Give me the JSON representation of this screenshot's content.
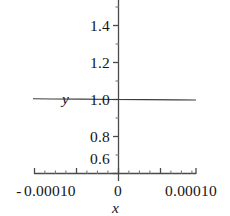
{
  "figure": {
    "background_color": "#ffffff",
    "ink_color": "#161616",
    "axis_color": "#4a4a4a",
    "curve_color": "#3d3d3d"
  },
  "axis_titles": {
    "x": "x",
    "y": "y"
  },
  "chart_data": {
    "type": "line",
    "title": "",
    "subtitle": "",
    "xlabel": "x",
    "ylabel": "y",
    "grid": false,
    "legend": null,
    "xlim": [
      -0.00013,
      0.00013
    ],
    "ylim": [
      0.5,
      1.5
    ],
    "x_ticks": [
      -0.0001,
      0,
      0.0001
    ],
    "x_tick_labels": [
      "-0.00010",
      "0",
      "0.00010"
    ],
    "y_ticks": [
      0.6,
      0.8,
      1.0,
      1.2,
      1.4
    ],
    "y_tick_labels": [
      "0.6",
      "0.8",
      "1.0",
      "1.2",
      "1.4"
    ],
    "series": [
      {
        "name": "curve",
        "x": [
          -0.00013,
          -0.0001,
          -5e-05,
          0,
          5e-05,
          0.0001,
          0.00013
        ],
        "values": [
          1.004,
          1.003,
          1.002,
          1.0,
          0.999,
          0.998,
          0.997
        ]
      }
    ]
  },
  "x_tick_text": {
    "negative_sign": "-",
    "left": "0.00010",
    "center": "0",
    "right": "0.00010"
  },
  "y_tick_text": {
    "t14": "1.4",
    "t12": "1.2",
    "t10": "1.0",
    "t08": "0.8",
    "t06": "0.6"
  }
}
